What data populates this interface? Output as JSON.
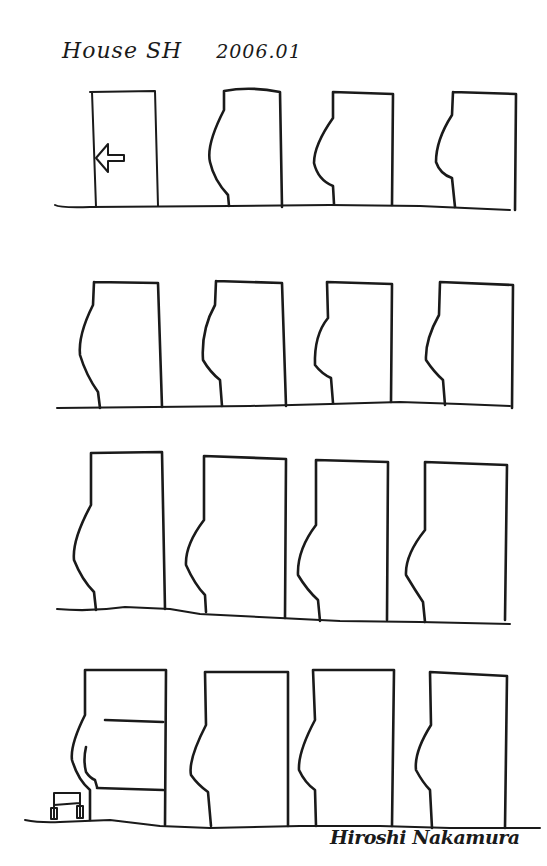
{
  "sketch": {
    "title": "House SH",
    "date": "2006.01",
    "signature": "Hiroshi Nakamura",
    "ink_color": "#1a1a1a",
    "paper_color": "#ffffff"
  },
  "rows": [
    {
      "name": "row-1",
      "ground": "M55,205 Q60,208 90,207 L230,206 L330,205 L420,206 L510,210",
      "facades": [
        {
          "name": "facade-1-1",
          "path": "M90,92 L155,91 L158,206 M92,92 L96,207",
          "note": "entrance with arrow"
        },
        {
          "name": "facade-1-2",
          "path": "M224,91 Q250,86 280,92 L282,207 M224,91 L224,110 Q206,145 210,162 Q214,180 228,195 L229,206"
        },
        {
          "name": "facade-1-3",
          "path": "M333,92 L393,94 L392,205 M333,92 L333,118 Q314,145 314,163 Q318,180 333,186 L334,204"
        },
        {
          "name": "facade-1-4",
          "path": "M453,92 L516,94 L515,210 M453,92 L452,115 Q436,140 436,162 Q440,174 452,178 L455,207"
        }
      ],
      "arrow": "M124,155 L108,155 L108,144 L96,158 L108,172 L108,161 L124,161 Z"
    },
    {
      "name": "row-2",
      "ground": "M57,408 L250,406 L330,404 L400,402 L460,404 L510,406",
      "facades": [
        {
          "name": "facade-2-1",
          "path": "M94,282 L158,283 L162,407 M94,282 L93,305 Q78,335 80,355 Q86,375 98,392 L100,408"
        },
        {
          "name": "facade-2-2",
          "path": "M216,281 L282,283 L286,406 M216,281 L215,305 Q201,330 203,360 Q210,372 220,380 L222,406"
        },
        {
          "name": "facade-2-3",
          "path": "M327,282 L392,284 L391,402 M327,282 L328,318 Q314,335 315,365 Q322,374 331,378 L333,403"
        },
        {
          "name": "facade-2-4",
          "path": "M440,282 L513,285 L512,408 M440,282 L439,315 Q425,340 426,360 Q434,372 443,380 L445,405"
        }
      ]
    },
    {
      "name": "row-3",
      "ground": "M57,609 Q90,612 125,607 L170,609 L200,614 L280,618 L340,621 L420,622 L510,624",
      "facades": [
        {
          "name": "facade-3-1",
          "path": "M91,453 L162,452 L165,609 M91,453 L91,505 Q72,540 74,560 Q82,580 94,592 L96,610"
        },
        {
          "name": "facade-3-2",
          "path": "M204,456 L286,459 L285,618 M204,456 L204,520 Q185,545 186,565 Q195,585 205,595 L206,612"
        },
        {
          "name": "facade-3-3",
          "path": "M316,460 L388,462 L387,620 M316,460 L316,525 Q297,550 298,575 Q307,590 318,600 L320,621"
        },
        {
          "name": "facade-3-4",
          "path": "M425,462 L507,465 L505,620 M425,462 L425,530 Q405,555 406,575 Q415,590 423,602 L425,622"
        }
      ]
    },
    {
      "name": "row-4",
      "ground": "M25,820 Q40,823 60,822 L110,820 L160,826 L210,828 L300,826 L380,826 L450,828 L540,828",
      "facades": [
        {
          "name": "facade-4-1",
          "path": "M85,670 L166,670 L165,825 M85,670 L85,715 Q70,745 72,760 Q78,780 90,790 L90,820 M105,720 L163,722 M97,788 L163,790",
          "note": "section with floors"
        },
        {
          "name": "facade-4-2",
          "path": "M205,672 L288,672 L288,826 M205,672 L206,725 Q188,760 191,775 Q198,785 208,792 L211,826"
        },
        {
          "name": "facade-4-3",
          "path": "M313,670 L394,670 L392,826 M313,670 L315,720 Q298,752 299,770 Q305,783 315,790 L316,826"
        },
        {
          "name": "facade-4-4",
          "path": "M430,672 L507,676 L505,828 M430,672 L431,725 Q414,752 416,770 Q423,783 430,790 L432,828"
        }
      ],
      "figure": "M86,747 Q83,760 86,772 Q90,778 95,780 L97,787",
      "chair": "M54,793 L80,793 L80,818 M54,793 L54,818 M54,805 L80,803 M51,808 L57,808 L57,819 L51,819 Z M77,806 L83,806 L83,818 L77,818 Z"
    }
  ]
}
